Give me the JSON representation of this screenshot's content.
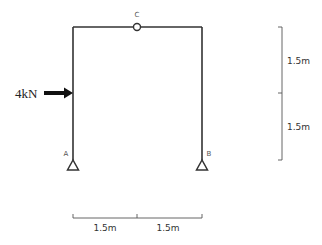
{
  "diagram": {
    "type": "three-hinged portal frame",
    "load": {
      "label": "4kN",
      "direction": "right"
    },
    "nodes": {
      "hinge_top": "C",
      "support_left": "A",
      "support_right": "B"
    },
    "dimensions": {
      "vertical": [
        "1.5m",
        "1.5m"
      ],
      "horizontal": [
        "1.5m",
        "1.5m"
      ]
    },
    "colors": {
      "line": "#333333",
      "dim": "#555555"
    }
  }
}
